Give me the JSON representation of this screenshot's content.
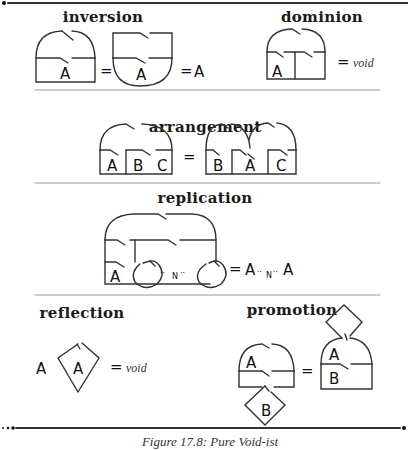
{
  "figure": {
    "caption": "Figure 17.8: Pure Void-ist",
    "line_color": "#333333",
    "sections": [
      {
        "id": "inversion",
        "title": "inversion",
        "equation": [
          "box-over-arch(A)",
          "=",
          "arch-under-box(A)",
          "=",
          "A"
        ]
      },
      {
        "id": "dominion",
        "title": "dominion",
        "equation": [
          "arch(A | empty)",
          "=",
          "void"
        ]
      },
      {
        "id": "arrangement",
        "title": "arrangement",
        "equation": [
          "arch(A B C)",
          "=",
          "arch(B A C)"
        ]
      },
      {
        "id": "replication",
        "title": "replication",
        "equation": [
          "replicator(A, N)",
          "=",
          "A ..N.. A"
        ]
      },
      {
        "id": "reflection",
        "title": "reflection",
        "equation": [
          "A",
          "diamond(A)",
          "=",
          "void"
        ]
      },
      {
        "id": "promotion",
        "title": "promotion",
        "equation": [
          "arch(A)+diamond(B)",
          "=",
          "diamond+arch(A/B)"
        ]
      }
    ]
  },
  "labels": {
    "A": "A",
    "B": "B",
    "C": "C",
    "N": "N",
    "eq": "=",
    "void": "void",
    "dots_left": "··",
    "dots_right": "··",
    "rep_result_a1": "A",
    "rep_result_a2": "A"
  }
}
